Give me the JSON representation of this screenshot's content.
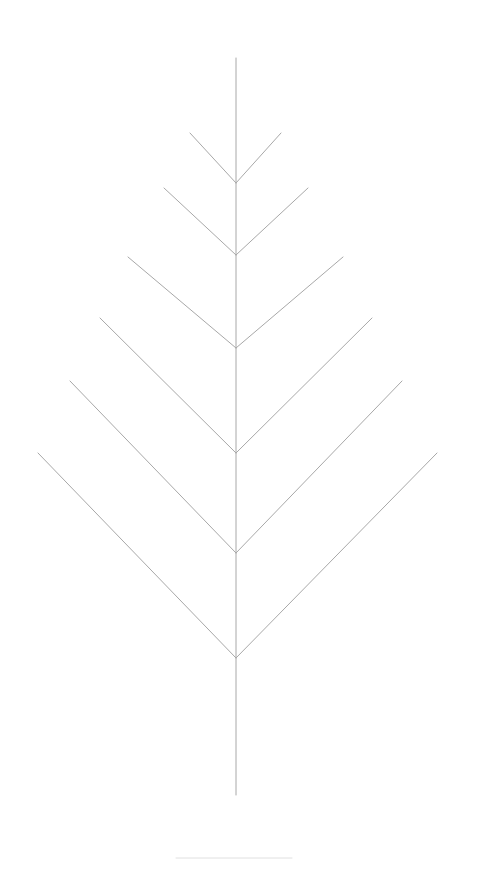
{
  "figure": {
    "kind": "line-drawing",
    "background_color": "#ffffff",
    "canvas": {
      "width": 484,
      "height": 869
    }
  },
  "style": {
    "stroke_color": "#a0a0a0",
    "stroke_color_light": "#c9c9c9",
    "stroke_color_faint": "#e2e2e2",
    "midrib_width": 1,
    "vein_width": 1,
    "footer_rule_width": 1
  },
  "chart_data": {
    "type": "line",
    "xlabel": "",
    "ylabel": "",
    "xlim": [
      0,
      484
    ],
    "ylim": [
      0,
      869
    ],
    "grid": false,
    "legend": "none",
    "axis_origin": "top-left",
    "midrib": {
      "name": "midrib",
      "x": 236,
      "y_top": 58,
      "y_bottom": 795,
      "color": "#a8a8a8",
      "width": 1
    },
    "vein_pairs": [
      {
        "index": 1,
        "junction": {
          "x": 236,
          "y": 183
        },
        "left_tip": {
          "x": 190,
          "y": 133
        },
        "right_tip": {
          "x": 281,
          "y": 133
        },
        "half_span": 46,
        "rise": 50,
        "color": "#a8a8a8"
      },
      {
        "index": 2,
        "junction": {
          "x": 236,
          "y": 255
        },
        "left_tip": {
          "x": 164,
          "y": 188
        },
        "right_tip": {
          "x": 308,
          "y": 188
        },
        "half_span": 72,
        "rise": 67,
        "color": "#a8a8a8"
      },
      {
        "index": 3,
        "junction": {
          "x": 236,
          "y": 348
        },
        "left_tip": {
          "x": 128,
          "y": 257
        },
        "right_tip": {
          "x": 343,
          "y": 257
        },
        "half_span": 108,
        "rise": 91,
        "color": "#a8a8a8"
      },
      {
        "index": 4,
        "junction": {
          "x": 236,
          "y": 453
        },
        "left_tip": {
          "x": 100,
          "y": 318
        },
        "right_tip": {
          "x": 372,
          "y": 318
        },
        "half_span": 136,
        "rise": 135,
        "color": "#a8a8a8"
      },
      {
        "index": 5,
        "junction": {
          "x": 236,
          "y": 553
        },
        "left_tip": {
          "x": 70,
          "y": 381
        },
        "right_tip": {
          "x": 402,
          "y": 381
        },
        "half_span": 166,
        "rise": 172,
        "color": "#a8a8a8"
      },
      {
        "index": 6,
        "junction": {
          "x": 236,
          "y": 658
        },
        "left_tip": {
          "x": 38,
          "y": 453
        },
        "right_tip": {
          "x": 437,
          "y": 453
        },
        "half_span": 198,
        "rise": 205,
        "color": "#a8a8a8"
      }
    ],
    "footer_rule": {
      "name": "footer-rule",
      "x_start": 176,
      "x_end": 292,
      "y": 858,
      "color": "#e0e0e0",
      "width": 1
    },
    "counts": {
      "vein_pairs": 6,
      "total_veins": 12,
      "midribs": 1
    }
  }
}
